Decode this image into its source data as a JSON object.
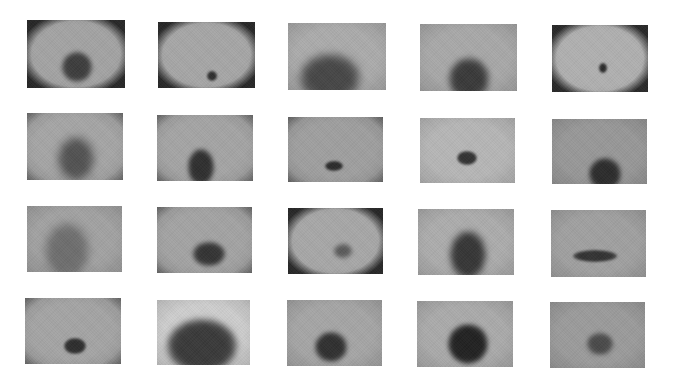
{
  "figure": {
    "layout": {
      "rows": 4,
      "cols": 5,
      "background": "#ffffff"
    },
    "images": [
      {
        "id": 1,
        "row": 1,
        "col": 1,
        "x": 27,
        "y": 20,
        "w": 98,
        "h": 68,
        "skin": "#a3a3a3",
        "vignette": "circle-dark",
        "lesion": {
          "cx": 50,
          "cy": 47,
          "rx": 15,
          "ry": 15,
          "color": "#3d3d3d",
          "blur": 2
        }
      },
      {
        "id": 2,
        "row": 1,
        "col": 2,
        "x": 158,
        "y": 22,
        "w": 97,
        "h": 66,
        "skin": "#a6a6a6",
        "vignette": "circle-dark",
        "lesion": {
          "cx": 54,
          "cy": 54,
          "rx": 5,
          "ry": 5,
          "color": "#2e2e2e",
          "blur": 1
        }
      },
      {
        "id": 3,
        "row": 1,
        "col": 3,
        "x": 288,
        "y": 23,
        "w": 98,
        "h": 67,
        "skin": "#ababab",
        "vignette": "none",
        "lesion": {
          "cx": 42,
          "cy": 55,
          "rx": 30,
          "ry": 24,
          "color": "#474747",
          "blur": 4
        }
      },
      {
        "id": 4,
        "row": 1,
        "col": 4,
        "x": 420,
        "y": 24,
        "w": 97,
        "h": 67,
        "skin": "#a8a8a8",
        "vignette": "none",
        "lesion": {
          "cx": 49,
          "cy": 55,
          "rx": 20,
          "ry": 21,
          "color": "#3a3a3a",
          "blur": 3
        }
      },
      {
        "id": 5,
        "row": 1,
        "col": 5,
        "x": 552,
        "y": 25,
        "w": 96,
        "h": 67,
        "skin": "#b0b0b0",
        "vignette": "circle-dark",
        "lesion": {
          "cx": 51,
          "cy": 43,
          "rx": 4,
          "ry": 5,
          "color": "#2a2a2a",
          "blur": 1
        }
      },
      {
        "id": 6,
        "row": 2,
        "col": 1,
        "x": 27,
        "y": 113,
        "w": 96,
        "h": 67,
        "skin": "#a5a5a5",
        "vignette": "corners",
        "lesion": {
          "cx": 49,
          "cy": 46,
          "rx": 18,
          "ry": 22,
          "color": "#525252",
          "blur": 4
        }
      },
      {
        "id": 7,
        "row": 2,
        "col": 2,
        "x": 157,
        "y": 115,
        "w": 96,
        "h": 66,
        "skin": "#a4a4a4",
        "vignette": "corners",
        "lesion": {
          "cx": 44,
          "cy": 52,
          "rx": 13,
          "ry": 18,
          "color": "#2f2f2f",
          "blur": 2
        }
      },
      {
        "id": 8,
        "row": 2,
        "col": 3,
        "x": 288,
        "y": 117,
        "w": 95,
        "h": 65,
        "skin": "#9f9f9f",
        "vignette": "corners",
        "lesion": {
          "cx": 46,
          "cy": 49,
          "rx": 9,
          "ry": 5,
          "color": "#2b2b2b",
          "blur": 1
        }
      },
      {
        "id": 9,
        "row": 2,
        "col": 4,
        "x": 420,
        "y": 118,
        "w": 95,
        "h": 65,
        "skin": "#b6b6b6",
        "vignette": "none",
        "lesion": {
          "cx": 47,
          "cy": 40,
          "rx": 10,
          "ry": 7,
          "color": "#333333",
          "blur": 1
        }
      },
      {
        "id": 10,
        "row": 2,
        "col": 5,
        "x": 552,
        "y": 119,
        "w": 95,
        "h": 65,
        "skin": "#989898",
        "vignette": "none",
        "lesion": {
          "cx": 53,
          "cy": 55,
          "rx": 16,
          "ry": 16,
          "color": "#2c2c2c",
          "blur": 2
        }
      },
      {
        "id": 11,
        "row": 3,
        "col": 1,
        "x": 27,
        "y": 206,
        "w": 95,
        "h": 66,
        "skin": "#a2a2a2",
        "vignette": "none",
        "lesion": {
          "cx": 40,
          "cy": 45,
          "rx": 22,
          "ry": 28,
          "color": "#6e6e6e",
          "blur": 4
        }
      },
      {
        "id": 12,
        "row": 3,
        "col": 2,
        "x": 157,
        "y": 207,
        "w": 95,
        "h": 66,
        "skin": "#a3a3a3",
        "vignette": "corners",
        "lesion": {
          "cx": 52,
          "cy": 47,
          "rx": 16,
          "ry": 12,
          "color": "#343434",
          "blur": 2
        }
      },
      {
        "id": 13,
        "row": 3,
        "col": 3,
        "x": 288,
        "y": 208,
        "w": 95,
        "h": 66,
        "skin": "#a7a7a7",
        "vignette": "circle-dark",
        "lesion": {
          "cx": 55,
          "cy": 43,
          "rx": 9,
          "ry": 7,
          "color": "#5a5a5a",
          "blur": 2
        }
      },
      {
        "id": 14,
        "row": 3,
        "col": 4,
        "x": 418,
        "y": 209,
        "w": 96,
        "h": 66,
        "skin": "#acacac",
        "vignette": "none",
        "lesion": {
          "cx": 50,
          "cy": 46,
          "rx": 18,
          "ry": 24,
          "color": "#363636",
          "blur": 3
        }
      },
      {
        "id": 15,
        "row": 3,
        "col": 5,
        "x": 551,
        "y": 210,
        "w": 95,
        "h": 67,
        "skin": "#a0a0a0",
        "vignette": "none",
        "lesion": {
          "cx": 44,
          "cy": 46,
          "rx": 22,
          "ry": 6,
          "color": "#333333",
          "blur": 1
        }
      },
      {
        "id": 16,
        "row": 4,
        "col": 1,
        "x": 25,
        "y": 298,
        "w": 96,
        "h": 66,
        "skin": "#a4a4a4",
        "vignette": "corners",
        "lesion": {
          "cx": 50,
          "cy": 48,
          "rx": 11,
          "ry": 8,
          "color": "#2e2e2e",
          "blur": 1
        }
      },
      {
        "id": 17,
        "row": 4,
        "col": 2,
        "x": 157,
        "y": 300,
        "w": 93,
        "h": 65,
        "skin": "#cdcdcd",
        "vignette": "none",
        "lesion": {
          "cx": 45,
          "cy": 46,
          "rx": 35,
          "ry": 27,
          "color": "#3a3a3a",
          "blur": 3
        }
      },
      {
        "id": 18,
        "row": 4,
        "col": 3,
        "x": 287,
        "y": 300,
        "w": 95,
        "h": 66,
        "skin": "#a5a5a5",
        "vignette": "none",
        "lesion": {
          "cx": 44,
          "cy": 47,
          "rx": 16,
          "ry": 15,
          "color": "#303030",
          "blur": 2
        }
      },
      {
        "id": 19,
        "row": 4,
        "col": 4,
        "x": 417,
        "y": 301,
        "w": 96,
        "h": 66,
        "skin": "#aaaaaa",
        "vignette": "none",
        "lesion": {
          "cx": 51,
          "cy": 43,
          "rx": 20,
          "ry": 20,
          "color": "#222222",
          "blur": 2
        }
      },
      {
        "id": 20,
        "row": 4,
        "col": 5,
        "x": 550,
        "y": 302,
        "w": 95,
        "h": 66,
        "skin": "#9b9b9b",
        "vignette": "none",
        "lesion": {
          "cx": 50,
          "cy": 42,
          "rx": 13,
          "ry": 11,
          "color": "#4a4a4a",
          "blur": 2
        }
      }
    ]
  }
}
